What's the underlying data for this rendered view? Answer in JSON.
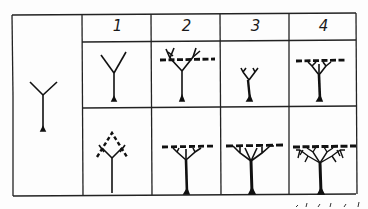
{
  "figure": {
    "columns": [
      {
        "label": "1"
      },
      {
        "label": "2"
      },
      {
        "label": "3"
      },
      {
        "label": "4"
      }
    ],
    "rows": [
      {
        "name": "row-top",
        "cells": [
          "young-fork-tree",
          "dashed-crown-line-branching",
          "small-fork-tree",
          "flat-crown-with-dashed-line"
        ]
      },
      {
        "name": "row-bottom",
        "cells": [
          "dashed-diamond-crown",
          "flat-crown-dashed-line",
          "spreading-flat-crown",
          "dense-spreading-crown"
        ]
      }
    ],
    "left_cell": "initial-fork-seedling",
    "colors": {
      "ink": "#1a1a1a",
      "background": "#fdfdfd"
    }
  }
}
